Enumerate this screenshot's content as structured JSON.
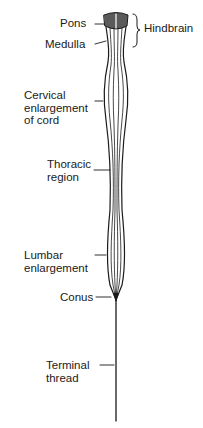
{
  "diagram": {
    "labels": {
      "pons": "Pons",
      "medulla": "Medulla",
      "hindbrain": "Hindbrain",
      "cervical": [
        "Cervical",
        "enlargement",
        "of cord"
      ],
      "thoracic": [
        "Thoracic",
        "region"
      ],
      "lumbar": [
        "Lumbar",
        "enlargement"
      ],
      "conus": "Conus",
      "terminal": [
        "Terminal",
        "thread"
      ]
    },
    "colors": {
      "ink": "#1a1a1a",
      "background": "#ffffff"
    }
  }
}
